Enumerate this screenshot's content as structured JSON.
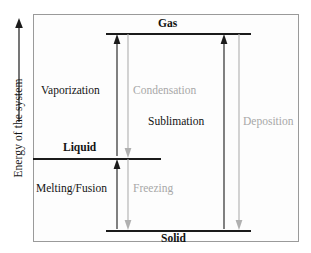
{
  "diagram": {
    "title_axis": "Energy of the system",
    "axis": {
      "label": "Energy of the system",
      "direction": "up",
      "arrow_icon": "up-arrow-icon"
    },
    "phases": [
      {
        "id": "gas",
        "label": "Gas",
        "energy_rank": 3,
        "color": "#121212"
      },
      {
        "id": "liquid",
        "label": "Liquid",
        "energy_rank": 2,
        "color": "#121212"
      },
      {
        "id": "solid",
        "label": "Solid",
        "energy_rank": 1,
        "color": "#121212"
      }
    ],
    "transitions": [
      {
        "id": "vaporization",
        "label": "Vaporization",
        "from": "Liquid",
        "to": "Gas",
        "type": "endothermic",
        "direction": "up",
        "color": "#131313"
      },
      {
        "id": "condensation",
        "label": "Condensation",
        "from": "Gas",
        "to": "Liquid",
        "type": "exothermic",
        "direction": "down",
        "color": "#a8a8a8"
      },
      {
        "id": "sublimation",
        "label": "Sublimation",
        "from": "Solid",
        "to": "Gas",
        "type": "endothermic",
        "direction": "up",
        "color": "#131313"
      },
      {
        "id": "deposition",
        "label": "Deposition",
        "from": "Gas",
        "to": "Solid",
        "type": "exothermic",
        "direction": "down",
        "color": "#a8a8a8"
      },
      {
        "id": "melting_fusion",
        "label": "Melting/Fusion",
        "from": "Solid",
        "to": "Liquid",
        "type": "endothermic",
        "direction": "up",
        "color": "#131313"
      },
      {
        "id": "freezing",
        "label": "Freezing",
        "from": "Liquid",
        "to": "Solid",
        "type": "exothermic",
        "direction": "down",
        "color": "#a8a8a8"
      }
    ],
    "colors": {
      "endothermic": "#131313",
      "exothermic": "#a8a8a8",
      "level_line": "#1b1b1b",
      "frame": "#9a9a9a",
      "background": "#fdfdfd"
    }
  }
}
